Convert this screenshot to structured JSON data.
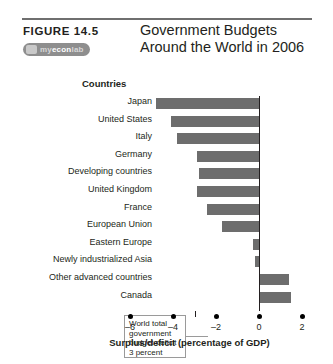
{
  "header": {
    "figure_label": "FIGURE  14.5",
    "badge": {
      "prefix": "my",
      "main": "econ",
      "suffix": "lab",
      "name": "myeconlab-badge"
    },
    "title_line1": "Government Budgets",
    "title_line2": "Around the World in 2006"
  },
  "annotation": {
    "text": "World total government budget deficit 3 percent"
  },
  "chart_data": {
    "type": "bar",
    "orientation": "horizontal",
    "title": "Government Budgets Around the World in 2006",
    "xlabel": "Surplus/deficit (percentage of GDP)",
    "ylabel": "Countries",
    "xlim": [
      -6.9,
      2.7
    ],
    "xticks": [
      -6,
      -4,
      -2,
      0,
      2
    ],
    "xtick_labels": [
      "–6",
      "–4",
      "–2",
      "0",
      "2"
    ],
    "grid": false,
    "legend": false,
    "bar_color": "#6d6d6d",
    "zero_line_color": "#231f20",
    "categories": [
      "Japan",
      "United States",
      "Italy",
      "Germany",
      "Developing countries",
      "United Kingdom",
      "France",
      "European Union",
      "Eastern Europe",
      "Newly industrialized Asia",
      "Other advanced countries",
      "Canada"
    ],
    "values": [
      -4.8,
      -4.1,
      -3.8,
      -2.9,
      -2.8,
      -2.9,
      -2.4,
      -1.7,
      -0.3,
      -0.2,
      1.4,
      1.5
    ],
    "annotations": [
      {
        "text": "World total government budget deficit 3 percent",
        "value": -3
      }
    ]
  }
}
